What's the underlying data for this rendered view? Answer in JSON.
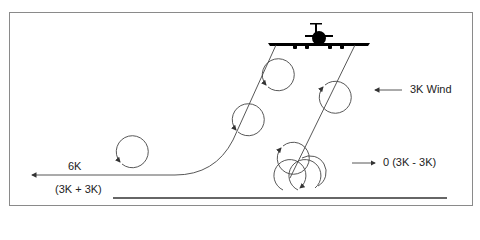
{
  "diagram": {
    "title_cut": "",
    "labels": {
      "wind": "3K Wind",
      "left_speed": "6K",
      "left_formula": "(3K + 3K)",
      "right_result": "0 (3K - 3K)"
    },
    "icons": {
      "aircraft": "aircraft-front-silhouette",
      "wind_arrow": "arrow-left",
      "left_arrow": "arrow-left",
      "result_arrow": "arrow-right",
      "vortex": "circular-arrow"
    },
    "colors": {
      "line": "#444444",
      "frame": "#8a8a8a",
      "aircraft": "#000000",
      "ground": "#333333"
    }
  }
}
